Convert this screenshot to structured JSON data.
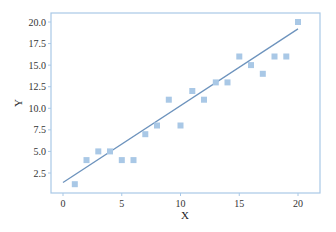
{
  "chart_data": {
    "type": "scatter",
    "title": "",
    "xlabel": "X",
    "ylabel": "Y",
    "xlim": [
      -1,
      21.5
    ],
    "ylim": [
      0.7,
      21
    ],
    "x_ticks": [
      0,
      5,
      10,
      15,
      20
    ],
    "x_tick_labels": [
      "0",
      "5",
      "10",
      "15",
      "20"
    ],
    "y_ticks": [
      2.5,
      5.0,
      7.5,
      10.0,
      12.5,
      15.0,
      17.5,
      20.0
    ],
    "y_tick_labels": [
      "2.5",
      "5.0",
      "7.5",
      "10.0",
      "12.5",
      "15.0",
      "17.5",
      "20.0"
    ],
    "grid": false,
    "legend": null,
    "series": [
      {
        "name": "data",
        "kind": "scatter",
        "marker": "square",
        "color": "#a9c8e6",
        "x": [
          1,
          2,
          3,
          4,
          5,
          6,
          7,
          8,
          9,
          10,
          11,
          12,
          13,
          14,
          15,
          16,
          17,
          18,
          19,
          20
        ],
        "y": [
          1.2,
          4,
          5,
          5,
          4,
          4,
          7,
          8,
          11,
          8,
          12,
          11,
          13,
          13,
          16,
          15,
          14,
          16,
          16,
          20
        ]
      },
      {
        "name": "fit",
        "kind": "line",
        "color": "#6d93bd",
        "x": [
          0,
          20
        ],
        "y": [
          1.4,
          19.2
        ]
      }
    ]
  },
  "style": {
    "frame_color": "#a9c8e6",
    "tick_color": "#a9c8e6"
  }
}
